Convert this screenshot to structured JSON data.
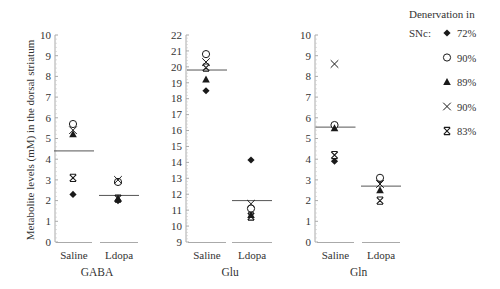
{
  "chart_data": [
    {
      "type": "scatter",
      "title": "GABA",
      "xlabel": "GABA",
      "ylabel": "Metabolite levels (mM) in the dorsal striatum",
      "categories": [
        "Saline",
        "Ldopa"
      ],
      "ylim": [
        0,
        10
      ],
      "yticks": [
        0,
        1,
        2,
        3,
        4,
        5,
        6,
        7,
        8,
        9,
        10
      ],
      "means": [
        4.4,
        2.25
      ],
      "series": [
        {
          "name": "72%",
          "marker": "diamond",
          "values": [
            2.3,
            2.0
          ]
        },
        {
          "name": "90%",
          "marker": "circle",
          "values": [
            5.7,
            2.9
          ]
        },
        {
          "name": "89%",
          "marker": "triangle",
          "values": [
            5.2,
            2.1
          ]
        },
        {
          "name": "90%",
          "marker": "x",
          "values": [
            5.4,
            3.0
          ]
        },
        {
          "name": "83%",
          "marker": "asterisk",
          "values": [
            3.1,
            2.1
          ]
        }
      ]
    },
    {
      "type": "scatter",
      "title": "Glu",
      "xlabel": "Glu",
      "ylabel": "",
      "categories": [
        "Saline",
        "Ldopa"
      ],
      "ylim": [
        9,
        22
      ],
      "yticks": [
        9,
        10,
        11,
        12,
        13,
        14,
        15,
        16,
        17,
        18,
        19,
        20,
        21,
        22
      ],
      "means": [
        19.8,
        11.6
      ],
      "series": [
        {
          "name": "72%",
          "marker": "diamond",
          "values": [
            18.5,
            14.15
          ]
        },
        {
          "name": "90%",
          "marker": "circle",
          "values": [
            20.8,
            11.1
          ]
        },
        {
          "name": "89%",
          "marker": "triangle",
          "values": [
            19.2,
            10.7
          ]
        },
        {
          "name": "90%",
          "marker": "x",
          "values": [
            20.3,
            11.4
          ]
        },
        {
          "name": "83%",
          "marker": "asterisk",
          "values": [
            19.95,
            10.6
          ]
        }
      ]
    },
    {
      "type": "scatter",
      "title": "Gln",
      "xlabel": "Gln",
      "ylabel": "",
      "categories": [
        "Saline",
        "Ldopa"
      ],
      "ylim": [
        0,
        10
      ],
      "yticks": [
        0,
        1,
        2,
        3,
        4,
        5,
        6,
        7,
        8,
        9,
        10
      ],
      "means": [
        5.55,
        2.7
      ],
      "series": [
        {
          "name": "72%",
          "marker": "diamond",
          "values": [
            3.9,
            3.0
          ]
        },
        {
          "name": "90%",
          "marker": "circle",
          "values": [
            5.65,
            3.1
          ]
        },
        {
          "name": "89%",
          "marker": "triangle",
          "values": [
            5.5,
            2.5
          ]
        },
        {
          "name": "90%",
          "marker": "x",
          "values": [
            8.6,
            2.8
          ]
        },
        {
          "name": "83%",
          "marker": "asterisk",
          "values": [
            4.2,
            2.0
          ]
        }
      ]
    }
  ],
  "legend": {
    "title_line1": "Denervation in",
    "title_line2": "SNc:",
    "items": [
      {
        "marker": "diamond",
        "label": "72%"
      },
      {
        "marker": "circle",
        "label": "90%"
      },
      {
        "marker": "triangle",
        "label": "89%"
      },
      {
        "marker": "x",
        "label": "90%"
      },
      {
        "marker": "asterisk",
        "label": "83%"
      }
    ]
  },
  "ylabel": "Metabolite levels (mM) in the dorsal striatum"
}
